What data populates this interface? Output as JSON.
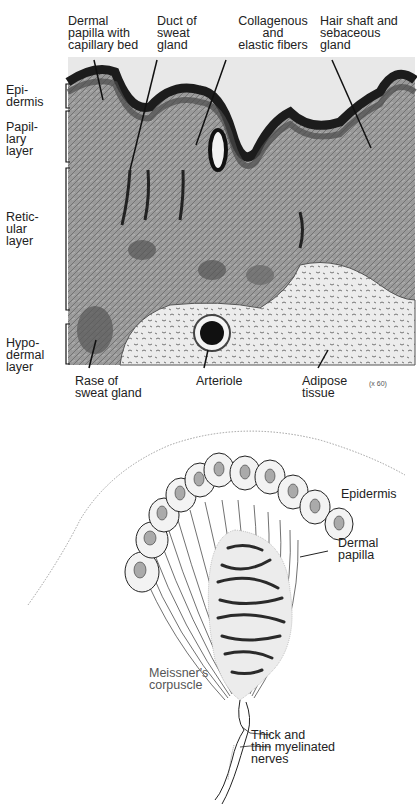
{
  "figure_top": {
    "title": "Histological section of skin",
    "top_labels": [
      {
        "id": "dermal-papilla",
        "text": "Dermal\npapilla with\ncapillary bed"
      },
      {
        "id": "duct-sweat-gland",
        "text": "Duct of\nsweat\ngland"
      },
      {
        "id": "collagenous-fibers",
        "text": "Collagenous\nand\nelastic fibers"
      },
      {
        "id": "hair-shaft",
        "text": "Hair shaft and\nsebaceous\ngland"
      }
    ],
    "side_labels": [
      {
        "id": "epidermis",
        "text": "Epi-\ndermis"
      },
      {
        "id": "papillary",
        "text": "Papil-\nlary\nlayer"
      },
      {
        "id": "reticular",
        "text": "Retic-\nular\nlayer"
      },
      {
        "id": "hypodermal",
        "text": "Hypo-\ndermal\nlayer"
      }
    ],
    "bottom_labels": [
      {
        "id": "base-sweat-gland",
        "text": "Rase of\nsweat gland"
      },
      {
        "id": "arteriole",
        "text": "Arteriole"
      },
      {
        "id": "adipose",
        "text": "Adipose\ntissue"
      }
    ],
    "magnification": "(x 60)"
  },
  "figure_bottom": {
    "title": "Meissner's corpuscle diagram",
    "labels": [
      {
        "id": "epidermis",
        "text": "Epidermis"
      },
      {
        "id": "dermal-papilla",
        "text": "Dermal\npapilla"
      },
      {
        "id": "meissner",
        "text": "Meissner's\ncorpuscle"
      },
      {
        "id": "nerves",
        "text": "Thick and\nthin myelinated\nnerves"
      }
    ]
  },
  "colors": {
    "tissue_dark": "#2a2a2a",
    "tissue_mid": "#8a8a8a",
    "tissue_light": "#d8d8d8",
    "background": "#ffffff"
  }
}
